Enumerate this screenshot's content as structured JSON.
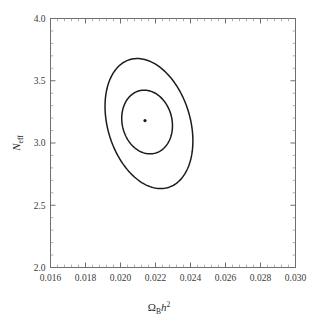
{
  "chart_data": {
    "type": "scatter",
    "title": "",
    "subtitle": "",
    "xlabel": "Ω_B h^2",
    "xlabel_parts": {
      "symbol": "Ω",
      "subscript": "B",
      "variable": "h",
      "superscript": "2"
    },
    "ylabel": "N_eff",
    "ylabel_parts": {
      "symbol": "N",
      "subscript": "eff"
    },
    "xlim": [
      0.016,
      0.03
    ],
    "ylim": [
      2.0,
      4.0
    ],
    "x_major_ticks": [
      0.016,
      0.018,
      0.02,
      0.022,
      0.024,
      0.026,
      0.028,
      0.03
    ],
    "x_tick_labels": [
      "0.016",
      "0.018",
      "0.020",
      "0.022",
      "0.024",
      "0.026",
      "0.028",
      "0.030"
    ],
    "y_major_ticks": [
      2.0,
      2.5,
      3.0,
      3.5,
      4.0
    ],
    "y_tick_labels": [
      "2.0",
      "2.5",
      "3.0",
      "3.5",
      "4.0"
    ],
    "x_minor_per_major": 4,
    "y_minor_per_major": 4,
    "grid": false,
    "legend": null,
    "best_fit_point": {
      "x": 0.0214,
      "y": 3.18,
      "label": "best-fit"
    },
    "contours": [
      {
        "name": "outer-confidence-contour",
        "level": "95%",
        "center": {
          "x": 0.0214,
          "y": 3.19
        },
        "semi_axis_x": 0.00235,
        "semi_axis_y": 0.535,
        "rotation_deg": -17,
        "x_range": [
          0.0192,
          0.0239
        ],
        "y_range": [
          2.66,
          3.73
        ]
      },
      {
        "name": "inner-confidence-contour",
        "level": "68%",
        "center": {
          "x": 0.0214,
          "y": 3.185
        },
        "semi_axis_x": 0.00142,
        "semi_axis_y": 0.258,
        "rotation_deg": -14,
        "x_range": [
          0.0201,
          0.0229
        ],
        "y_range": [
          2.93,
          3.44
        ]
      }
    ]
  },
  "style": {
    "background_color": "#ffffff",
    "contour_color": "#1b1b1b",
    "frame_color": "#6e6e6e",
    "text_color": "#2b2b2b"
  }
}
